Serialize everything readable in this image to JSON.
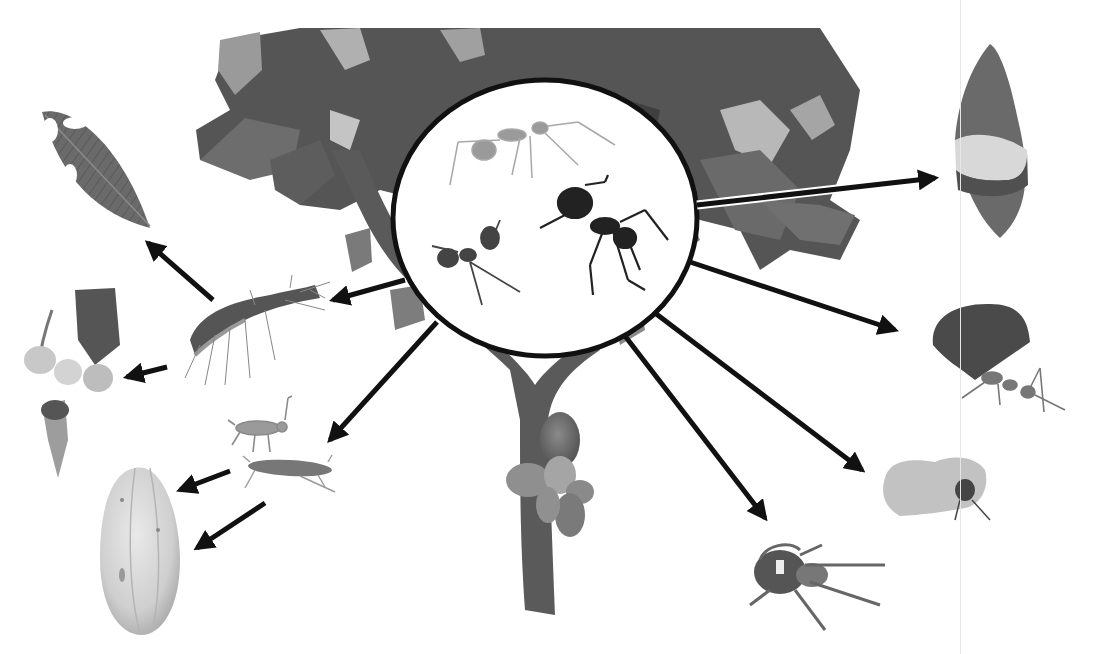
{
  "diagram": {
    "type": "ecological-interaction-diagram",
    "text_labels": [],
    "colors": {
      "background": "#ffffff",
      "arrow": "#111111",
      "inset_ring": "#111111",
      "foliage_dark": "#4a4a4a",
      "foliage_mid": "#6f6f6f",
      "foliage_light": "#bdbdbd",
      "trunk": "#5e5e5e",
      "pod_light": "#d6d6d6",
      "divider": "#e6e6e6"
    },
    "central_node": {
      "id": "ants-inset",
      "description": "Circular inset on cacao tree containing three ants"
    },
    "nodes": [
      {
        "id": "leaf-damaged",
        "description": "Leaf with chewed holes"
      },
      {
        "id": "flowers",
        "description": "Cacao flower cluster"
      },
      {
        "id": "pod-healthy-large",
        "description": "Cacao pod"
      },
      {
        "id": "caterpillar",
        "description": "Hairy caterpillar"
      },
      {
        "id": "mirid-bugs",
        "description": "Mirid bug nymph and adult"
      },
      {
        "id": "pod-damaged",
        "description": "Cacao pod with lesion band"
      },
      {
        "id": "leafcutter-ant",
        "description": "Ant carrying leaf fragment"
      },
      {
        "id": "mealybug-pod",
        "description": "Pod with insect"
      },
      {
        "id": "spider",
        "description": "Jumping spider"
      }
    ],
    "edges": [
      {
        "from": "ants-inset",
        "to": "pod-damaged"
      },
      {
        "from": "ants-inset",
        "to": "leafcutter-ant"
      },
      {
        "from": "ants-inset",
        "to": "mealybug-pod"
      },
      {
        "from": "ants-inset",
        "to": "spider"
      },
      {
        "from": "ants-inset",
        "to": "caterpillar"
      },
      {
        "from": "ants-inset",
        "to": "mirid-bugs"
      },
      {
        "from": "caterpillar",
        "to": "leaf-damaged"
      },
      {
        "from": "caterpillar",
        "to": "flowers"
      },
      {
        "from": "mirid-bugs",
        "to": "pod-healthy-large"
      },
      {
        "from": "mirid-bugs",
        "to": "pod-healthy-large"
      }
    ]
  }
}
